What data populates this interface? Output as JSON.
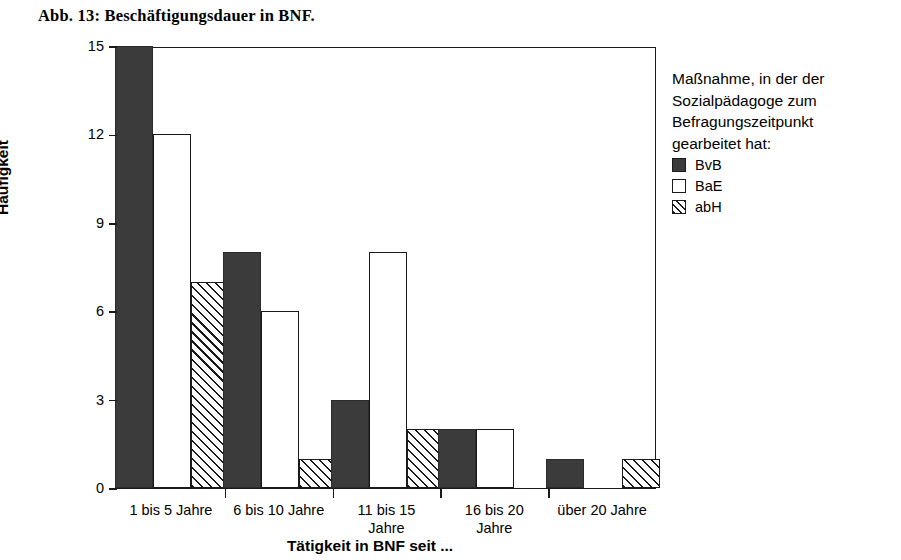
{
  "figure": {
    "title": "Abb. 13: Beschäftigungsdauer in BNF."
  },
  "legend": {
    "title": "Maßnahme, in der der\nSozialpädagoge zum\nBefragungszeitpunkt\ngearbeitet hat:",
    "entries": [
      {
        "label": "BvB",
        "swatch": "solid"
      },
      {
        "label": "BaE",
        "swatch": "open"
      },
      {
        "label": "abH",
        "swatch": "hatch"
      }
    ]
  },
  "axes": {
    "ylabel": "Häufigkeit",
    "xlabel": "Tätigkeit in BNF seit ...",
    "yticks": [
      "0",
      "3",
      "6",
      "9",
      "12",
      "15"
    ]
  },
  "colors": {
    "bvb_fill": "#3b3b3b",
    "bae_fill": "#ffffff",
    "abh_fill": "#ffffff",
    "outline": "#1a1a1a",
    "background": "#ffffff"
  },
  "chart_data": {
    "type": "bar",
    "title": "Abb. 13: Beschäftigungsdauer in BNF.",
    "xlabel": "Tätigkeit in BNF seit ...",
    "ylabel": "Häufigkeit",
    "ylim": [
      0,
      15
    ],
    "yticks": [
      0,
      3,
      6,
      9,
      12,
      15
    ],
    "grid": false,
    "legend_position": "right",
    "legend_title": "Maßnahme, in der der Sozialpädagoge zum Befragungszeitpunkt gearbeitet hat:",
    "categories": [
      "1 bis 5 Jahre",
      "6 bis 10 Jahre",
      "11 bis 15\nJahre",
      "16 bis 20\nJahre",
      "über 20 Jahre"
    ],
    "series": [
      {
        "name": "BvB",
        "fill": "solid",
        "values": [
          15,
          8,
          3,
          2,
          1
        ]
      },
      {
        "name": "BaE",
        "fill": "open",
        "values": [
          12,
          6,
          8,
          2,
          0
        ]
      },
      {
        "name": "abH",
        "fill": "hatch",
        "values": [
          7,
          1,
          2,
          0,
          1
        ]
      }
    ]
  }
}
